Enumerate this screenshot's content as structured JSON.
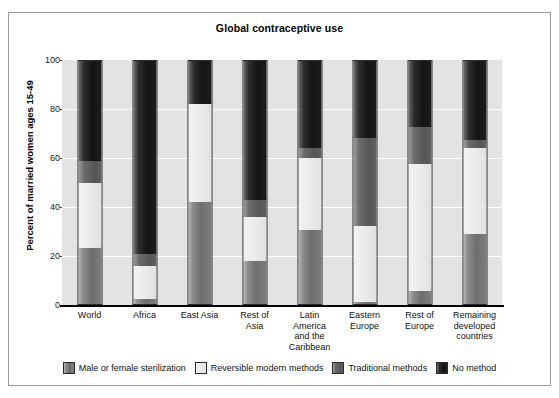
{
  "chart_data": {
    "type": "bar",
    "subtype": "stacked-bar-100",
    "title": "Global contraceptive use",
    "xlabel": "",
    "ylabel": "Percent of married women ages 15-49",
    "ylim": [
      0,
      100
    ],
    "yticks": [
      "0",
      "20",
      "40",
      "60",
      "80",
      "100"
    ],
    "grid": true,
    "legend_position": "bottom",
    "categories": [
      "World",
      "Africa",
      "East Asia",
      "Rest of Asia",
      "Latin America and the Caribbean",
      "Eastern Europe",
      "Rest of Europe",
      "Remaining developed countries"
    ],
    "category_label_lines": [
      [
        "World"
      ],
      [
        "Africa"
      ],
      [
        "East Asia"
      ],
      [
        "Rest of",
        "Asia"
      ],
      [
        "Latin",
        "America",
        "and the",
        "Caribbean"
      ],
      [
        "Eastern",
        "Europe"
      ],
      [
        "Rest of",
        "Europe"
      ],
      [
        "Remaining",
        "developed",
        "countries"
      ]
    ],
    "series": [
      {
        "name": "Male or female sterilization",
        "color": "#7d7d7d",
        "values": [
          23,
          2,
          42,
          17.5,
          30.5,
          1,
          5.5,
          29
        ]
      },
      {
        "name": "Reversible modern methods",
        "color": "#ededed",
        "values": [
          27,
          13.5,
          40.5,
          18.5,
          29.5,
          31,
          52,
          35
        ]
      },
      {
        "name": "Traditional methods",
        "color": "#5b5b5b",
        "values": [
          9,
          5,
          0,
          7,
          4,
          36.5,
          15.5,
          3.5
        ]
      },
      {
        "name": "No method",
        "color": "#171717",
        "values": [
          41,
          79.5,
          17.5,
          57,
          36,
          31.5,
          27,
          32.5
        ]
      }
    ]
  },
  "legend": {
    "items": [
      {
        "label": "Male or female sterilization",
        "swatch": "sterilization-swatch"
      },
      {
        "label": "Reversible modern methods",
        "swatch": "reversible-swatch"
      },
      {
        "label": "Traditional methods",
        "swatch": "traditional-swatch"
      },
      {
        "label": "No method",
        "swatch": "no-method-swatch"
      }
    ]
  }
}
